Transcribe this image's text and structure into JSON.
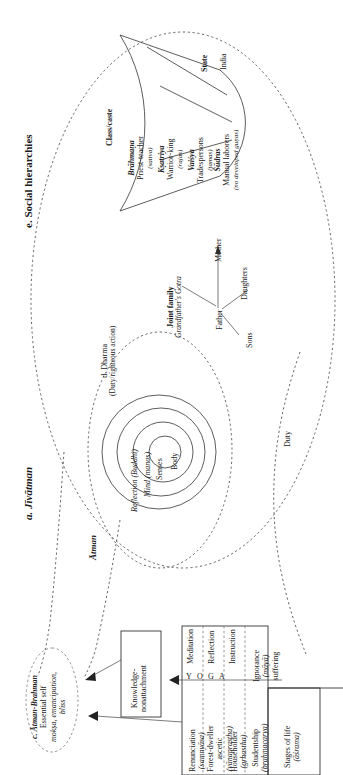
{
  "figure": {
    "orientation": "rotated-90-ccw",
    "kind": "nested-concept-diagram",
    "ink_color": "#1a1a1a",
    "dash_color": "#555555"
  },
  "labels": {
    "social_hierarchies": "e. Social hierarchies",
    "jivatman": "a. Jīvātman",
    "atman": "Ātman",
    "duty": "Duty",
    "state": "State",
    "india": "India",
    "class_caste": "Class/caste",
    "dharma_title": "d. Dharma",
    "dharma_sub": "(Duty/righteous action)",
    "joint_family_title": "Joint family",
    "joint_family_sub": "Grandfather's Gotra",
    "yoga_letters": [
      "Y",
      "O",
      "G",
      "A"
    ]
  },
  "varnas": [
    {
      "name": "Brāhmaṇa",
      "role": "Priest-teacher",
      "guna": "(sattva)"
    },
    {
      "name": "Kṣatriya",
      "role": "Warrior-king",
      "guna": "(rajas)"
    },
    {
      "name": "Vaiśya",
      "role": "Tradespersons",
      "guna": "(tamas)"
    },
    {
      "name": "Śūdras",
      "role": "Manual laborers",
      "guna": "(no developed guṇas)"
    }
  ],
  "family": {
    "father": "Father",
    "mother": "Mother",
    "sons": "Sons",
    "daughters": "Daughters"
  },
  "sheaths": [
    {
      "label": "Body"
    },
    {
      "label": "Senses"
    },
    {
      "label": "Mind (manas)"
    },
    {
      "label": "Reflection (Buddhi)"
    }
  ],
  "atman_brahman": {
    "title": "c. Ātman-Brahman",
    "line1": "Essential self",
    "line2": "mokṣa, emancipation,",
    "line3": "bliss"
  },
  "knowledge_box": {
    "line1": "Knowledge-",
    "line2": "nonattachment"
  },
  "ignorance": {
    "line1": "Ignorance",
    "line2": "(māyā)",
    "line3": "suffering"
  },
  "stages_title": {
    "line1": "Stages of life",
    "line2": "(āśrama)"
  },
  "stages": [
    {
      "name": "Renunciation",
      "term": "(saṃnyāsa)",
      "practice": "Meditation"
    },
    {
      "name": "Forest-dweller",
      "name2": "ascetic",
      "term": "(vānaprastha)",
      "practice": "Reflection"
    },
    {
      "name": "Householder",
      "term": "(gṛhastha)",
      "practice": "Instruction"
    },
    {
      "name": "Studentship",
      "term": "(brahmacarya)",
      "practice": ""
    }
  ]
}
